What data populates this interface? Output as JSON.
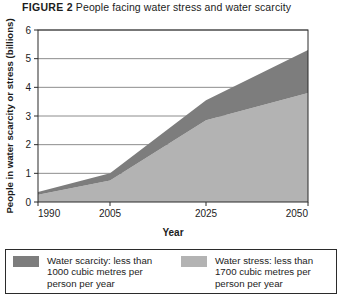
{
  "title": {
    "tag": "FIGURE 2",
    "text": "People facing water stress and water scarcity"
  },
  "legend": {
    "items": [
      {
        "name": "water-scarcity",
        "color": "#7d7d7d",
        "label": "Water scarcity: less than\n1000 cubic metres per\nperson per year"
      },
      {
        "name": "water-stress",
        "color": "#b3b3b3",
        "label": "Water stress: less than\n1700 cubic metres per\nperson per year"
      }
    ]
  },
  "chart_data": {
    "type": "area",
    "stacked": true,
    "title": "People facing water stress and water scarcity",
    "xlabel": "Year",
    "ylabel": "People in water scarcity or stress (billions)",
    "x": [
      1990,
      2005,
      2025,
      2050
    ],
    "xtick_labels": [
      "1990",
      "2005",
      "2025",
      "2050"
    ],
    "xlim": [
      1990,
      2050
    ],
    "ylim": [
      0,
      6
    ],
    "yticks": [
      0,
      1,
      2,
      3,
      4,
      5,
      6
    ],
    "ytick_labels": [
      "0",
      "1",
      "2",
      "3",
      "4",
      "5",
      "6"
    ],
    "grid": "horizontal",
    "legend_position": "below",
    "series": [
      {
        "name": "Water stress: less than 1700 cubic metres per person per year",
        "color": "#b3b3b3",
        "values": [
          0.25,
          0.75,
          2.85,
          3.8
        ]
      },
      {
        "name": "Water scarcity: less than 1000 cubic metres per person per year",
        "color": "#7d7d7d",
        "values": [
          0.1,
          0.25,
          0.7,
          1.5
        ]
      }
    ],
    "totals": [
      0.35,
      1.0,
      3.55,
      5.3
    ]
  }
}
